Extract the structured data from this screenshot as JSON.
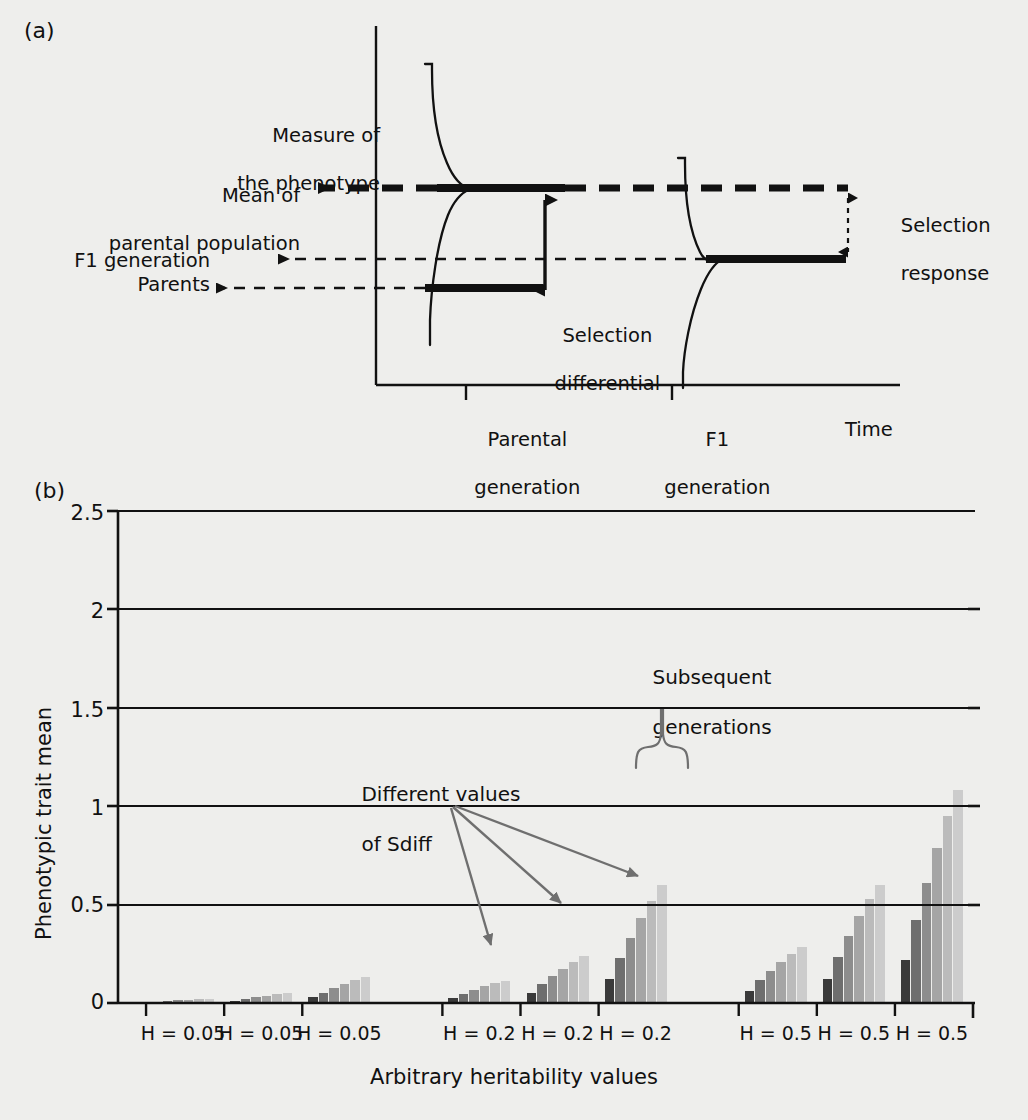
{
  "figure": {
    "panel_a_label": "(a)",
    "panel_b_label": "(b)"
  },
  "panel_a": {
    "labels": {
      "measure_line1": "Measure of",
      "measure_line2": "the phenotype",
      "mean_line1": "Mean of",
      "mean_line2": "parental population",
      "f1_generation": "F1 generation",
      "parents": "Parents",
      "selection_differential_line1": "Selection",
      "selection_differential_line2": "differential",
      "selection_response_line1": "Selection",
      "selection_response_line2": "response",
      "parental_generation_line1": "Parental",
      "parental_generation_line2": "generation",
      "f1_generation_tick_line1": "F1",
      "f1_generation_tick_line2": "generation",
      "time_axis": "Time"
    },
    "colors": {
      "ink": "#111111",
      "background": "#eeeeec"
    }
  },
  "panel_b": {
    "annotations": {
      "subsequent_line1": "Subsequent",
      "subsequent_line2": "generations",
      "sdiff_line1": "Different values",
      "sdiff_line2": "of Sdiff"
    },
    "colors": {
      "axis": "#111111",
      "grid": "#111111",
      "arrow": "#6f6f6f",
      "brace": "#6f6f6f",
      "background": "#eeeeec"
    },
    "series_colors": [
      "#3a3a3a",
      "#6e6e6e",
      "#8d8d8d",
      "#a5a5a5",
      "#bbbbbb",
      "#cccccc"
    ]
  },
  "chart_data": {
    "type": "bar",
    "title": "",
    "xlabel": "Arbitrary heritability values",
    "ylabel": "Phenotypic trait mean",
    "ylim": [
      0,
      2.5
    ],
    "yticks": [
      0,
      0.5,
      1,
      1.5,
      2,
      2.5
    ],
    "ytick_labels": [
      "0",
      "0.5",
      "1",
      "1.5",
      "2",
      "2.5"
    ],
    "grid": true,
    "legend": "none",
    "categories": [
      "H = 0.05",
      "H = 0.05",
      "H = 0.05",
      "H = 0.2",
      "H = 0.2",
      "H = 0.2",
      "H = 0.5",
      "H = 0.5",
      "H = 0.5"
    ],
    "series_label": "Subsequent generations",
    "series": [
      {
        "name": "generation 1",
        "values": [
          0.006,
          0.012,
          0.03,
          0.025,
          0.05,
          0.12,
          0.06,
          0.12,
          0.22
        ]
      },
      {
        "name": "generation 2",
        "values": [
          0.01,
          0.022,
          0.05,
          0.048,
          0.095,
          0.23,
          0.115,
          0.235,
          0.42
        ]
      },
      {
        "name": "generation 3",
        "values": [
          0.013,
          0.03,
          0.075,
          0.068,
          0.135,
          0.33,
          0.165,
          0.34,
          0.61
        ]
      },
      {
        "name": "generation 4",
        "values": [
          0.016,
          0.038,
          0.095,
          0.085,
          0.175,
          0.43,
          0.21,
          0.44,
          0.79
        ]
      },
      {
        "name": "generation 5",
        "values": [
          0.019,
          0.045,
          0.115,
          0.1,
          0.21,
          0.52,
          0.25,
          0.53,
          0.95
        ]
      },
      {
        "name": "generation 6",
        "values": [
          0.021,
          0.05,
          0.13,
          0.113,
          0.24,
          0.6,
          0.285,
          0.6,
          1.08
        ]
      }
    ],
    "note": "Nine heritability groups, each containing six successive generation bars shaded dark-to-light."
  }
}
